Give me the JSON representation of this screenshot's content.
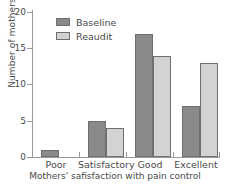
{
  "chart_data": {
    "type": "bar",
    "title": "",
    "xlabel": "Mothers' safisfaction with pain control",
    "ylabel": "Number of mothers",
    "categories": [
      "Poor",
      "Satisfactory",
      "Good",
      "Excellent"
    ],
    "series": [
      {
        "name": "Baseline",
        "values": [
          1,
          5,
          17,
          7
        ],
        "color": "#8a8a8a"
      },
      {
        "name": "Reaudit",
        "values": [
          0,
          4,
          14,
          13
        ],
        "color": "#d3d3d3"
      }
    ],
    "ylim": [
      0,
      20
    ],
    "yticks": [
      0,
      5,
      10,
      15,
      20
    ],
    "ytick_labels": [
      "0",
      "5",
      "10",
      "15",
      "20"
    ],
    "grid": false,
    "legend_position": "upper-left-inside"
  },
  "axes": {
    "y_title": "Number of mothers",
    "x_title": "Mothers' safisfaction with pain control",
    "y_tick_0": "0",
    "y_tick_1": "5",
    "y_tick_2": "10",
    "y_tick_3": "15",
    "y_tick_4": "20"
  },
  "legend": {
    "items": [
      {
        "label": "Baseline"
      },
      {
        "label": "Reaudit"
      }
    ]
  },
  "xticks": {
    "labels": [
      "Poor",
      "Satisfactory",
      "Good",
      "Excellent"
    ]
  },
  "colors": {
    "baseline": "#8a8a8a",
    "reaudit": "#d3d3d3",
    "bar_outline": "#6f6f6f",
    "axis": "#9a9a9a",
    "text": "#4a4a4a",
    "background": "#ffffff"
  }
}
